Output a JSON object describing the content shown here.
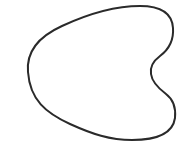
{
  "figure": {
    "description": "Closed curve outline shape",
    "stroke_color": "#2a2a2a",
    "fill_color": "#ffffff",
    "background_color": "#ffffff",
    "stroke_width": 2
  }
}
